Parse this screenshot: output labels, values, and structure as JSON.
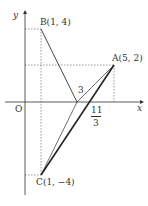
{
  "axes": {
    "x_label": "x",
    "y_label": "y",
    "origin_label": "O"
  },
  "points": {
    "A": {
      "label": "A(5, 2)",
      "x": 5,
      "y": 2
    },
    "B": {
      "label": "B(1, 4)",
      "x": 1,
      "y": 4
    },
    "C": {
      "label": "C(1, −4)",
      "x": 1,
      "y": -4
    }
  },
  "x_intercepts": {
    "three": "3",
    "frac_num": "11",
    "frac_den": "3"
  },
  "colors": {
    "line": "#333333",
    "dotted": "#555555"
  }
}
